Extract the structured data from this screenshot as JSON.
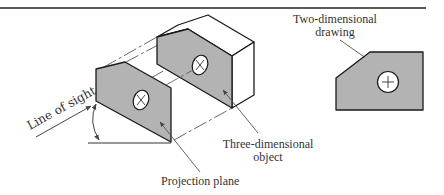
{
  "diagram": {
    "colors": {
      "face_fill": "#b3b3b3",
      "white_face": "#ffffff",
      "stroke": "#1a1a1a",
      "leader": "#555555",
      "rule": "#222222"
    },
    "labels": {
      "line_of_sight": "Line of sight",
      "two_dimensional_line1": "Two-dimensional",
      "two_dimensional_line2": "drawing",
      "three_dimensional_line1": "Three-dimensional",
      "three_dimensional_line2": "object",
      "projection_plane": "Projection plane"
    },
    "icons": {
      "hole_marker": "+",
      "hidden_hole_marker": "×"
    }
  }
}
